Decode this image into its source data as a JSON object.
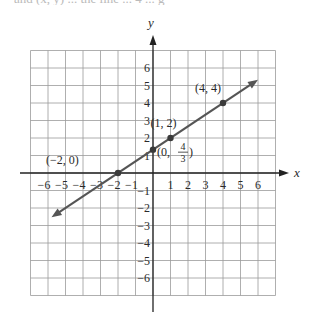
{
  "page": {
    "cropped_top_text": "and (x, y) ... the line ... 4 ... g"
  },
  "chart_data": {
    "type": "line",
    "title": "",
    "xlabel": "x",
    "ylabel": "y",
    "xlim": [
      -7,
      7
    ],
    "ylim": [
      -7,
      7
    ],
    "grid": true,
    "x_ticks": [
      -6,
      -5,
      -4,
      -3,
      -2,
      -1,
      1,
      2,
      3,
      4,
      5,
      6
    ],
    "y_ticks": [
      6,
      5,
      4,
      3,
      2,
      1,
      -1,
      -2,
      -3,
      -4,
      -5,
      -6
    ],
    "x_tick_labels": [
      "−6",
      "−5",
      "−4",
      "−3",
      "−2",
      "−1",
      "1",
      "2",
      "3",
      "4",
      "5",
      "6"
    ],
    "y_tick_labels": [
      "6",
      "5",
      "4",
      "3",
      "2",
      "1",
      "−1",
      "−2",
      "−3",
      "−4",
      "−5",
      "−6"
    ],
    "line": {
      "equation": "y = (2/3)x + 4/3",
      "slope": 0.6667,
      "intercept": 1.3333,
      "x_start": -5.8,
      "x_end": 6.0,
      "arrows": "both",
      "color": "#555555"
    },
    "points": [
      {
        "x": -2,
        "y": 0,
        "label": "(−2, 0)"
      },
      {
        "x": 0,
        "y": 1.3333,
        "label_prefix": "(0, ",
        "frac_num": "4",
        "frac_den": "3",
        "label_suffix": ")"
      },
      {
        "x": 1,
        "y": 2,
        "label": "(1, 2)"
      },
      {
        "x": 4,
        "y": 4,
        "label": "(4, 4)"
      }
    ]
  }
}
